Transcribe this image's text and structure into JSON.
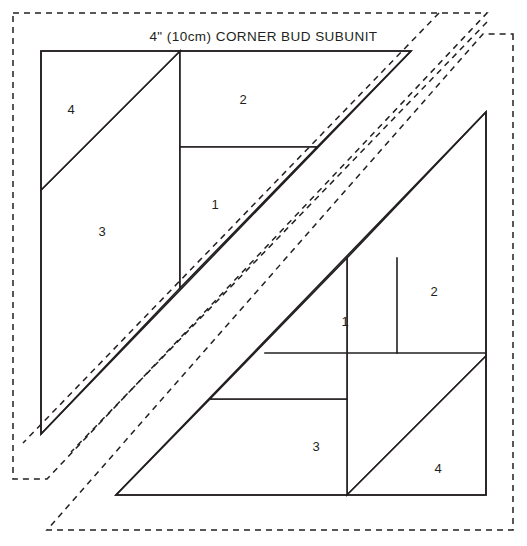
{
  "diagram": {
    "title": "4\" (10cm) CORNER BUD SUBUNIT",
    "colors": {
      "line": "#231f20",
      "background": "#ffffff"
    },
    "blocks": [
      {
        "name": "upper-left-block",
        "rotation_degrees": 0,
        "pieces": [
          {
            "id": "1",
            "label": "1",
            "label_x": 215,
            "label_y": 206
          },
          {
            "id": "2",
            "label": "2",
            "label_x": 243,
            "label_y": 101
          },
          {
            "id": "3",
            "label": "3",
            "label_y": 233,
            "label_x": 102
          },
          {
            "id": "4",
            "label": "4",
            "label_x": 71,
            "label_y": 111
          }
        ]
      },
      {
        "name": "lower-right-block",
        "rotation_degrees": 180,
        "pieces": [
          {
            "id": "1",
            "label": "1",
            "label_x": 345,
            "label_y": 323
          },
          {
            "id": "2",
            "label": "2",
            "label_x": 434,
            "label_y": 293
          },
          {
            "id": "3",
            "label": "3",
            "label_x": 316,
            "label_y": 448
          },
          {
            "id": "4",
            "label": "4",
            "label_x": 438,
            "label_y": 470
          }
        ]
      }
    ],
    "outer_seam_allowance": {
      "name": "dashed-seam-allowance",
      "style": "dashed"
    }
  }
}
